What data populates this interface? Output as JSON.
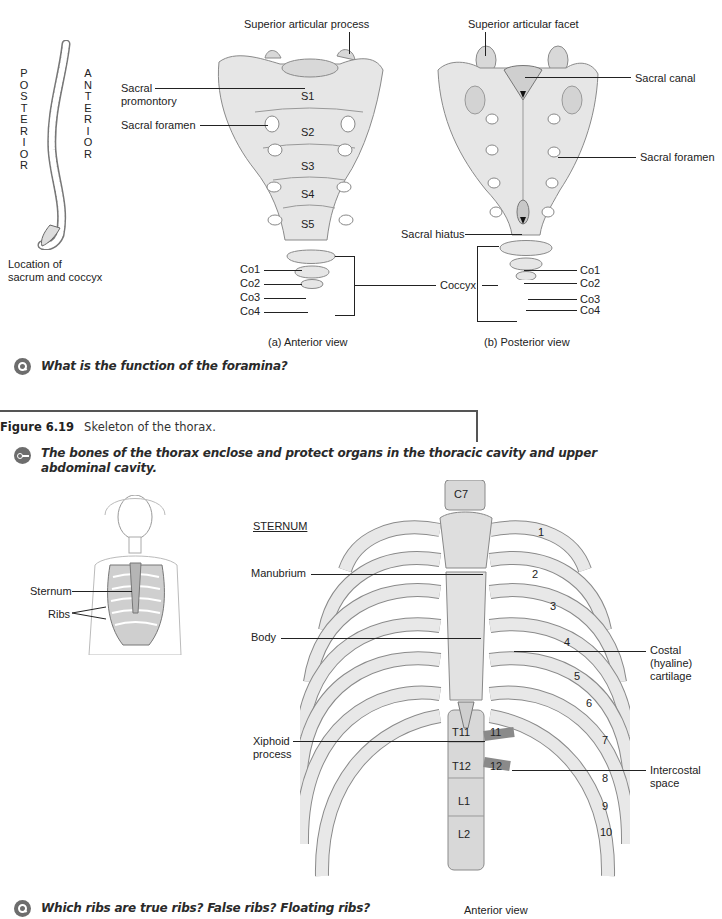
{
  "sacrum_figure": {
    "spine_thumbnail": {
      "posterior_letters": [
        "P",
        "O",
        "S",
        "T",
        "E",
        "R",
        "I",
        "O",
        "R"
      ],
      "anterior_letters": [
        "A",
        "N",
        "T",
        "E",
        "R",
        "I",
        "O",
        "R"
      ],
      "caption_line1": "Location of",
      "caption_line2": "sacrum and coccyx"
    },
    "anterior_view": {
      "caption": "(a) Anterior view",
      "labels": {
        "superior_articular_process": "Superior articular process",
        "sacral_promontory_1": "Sacral",
        "sacral_promontory_2": "promontory",
        "sacral_foramen": "Sacral foramen",
        "co1": "Co1",
        "co2": "Co2",
        "co3": "Co3",
        "co4": "Co4",
        "coccyx": "Coccyx"
      },
      "segments": [
        "S1",
        "S2",
        "S3",
        "S4",
        "S5"
      ]
    },
    "posterior_view": {
      "caption": "(b) Posterior view",
      "labels": {
        "superior_articular_facet": "Superior articular facet",
        "sacral_canal": "Sacral canal",
        "sacral_foramen": "Sacral foramen",
        "sacral_hiatus": "Sacral hiatus",
        "co1": "Co1",
        "co2": "Co2",
        "co3": "Co3",
        "co4": "Co4"
      }
    },
    "question": "What is the function of the foramina?"
  },
  "thorax_figure": {
    "figure_number": "Figure 6.19",
    "figure_title": "Skeleton of the thorax.",
    "key_message": "The bones of the thorax enclose and protect organs in the thoracic cavity and upper abdominal cavity.",
    "thumbnail_labels": {
      "sternum": "Sternum",
      "ribs": "Ribs"
    },
    "sternum_heading": "STERNUM",
    "labels": {
      "manubrium": "Manubrium",
      "body": "Body",
      "xiphoid_1": "Xiphoid",
      "xiphoid_2": "process",
      "costal_1": "Costal",
      "costal_2": "(hyaline)",
      "costal_3": "cartilage",
      "intercostal_1": "Intercostal",
      "intercostal_2": "space"
    },
    "vertebrae": [
      "C7",
      "T11",
      "T12",
      "L1",
      "L2"
    ],
    "rib_numbers": [
      "1",
      "2",
      "3",
      "4",
      "5",
      "6",
      "7",
      "8",
      "9",
      "10",
      "11",
      "12"
    ],
    "caption": "Anterior view",
    "question": "Which ribs are true ribs? False ribs? Floating ribs?"
  },
  "colors": {
    "bone_fill": "#e6e6e6",
    "icon_gray": "#6d6d6d",
    "text": "#222222"
  }
}
